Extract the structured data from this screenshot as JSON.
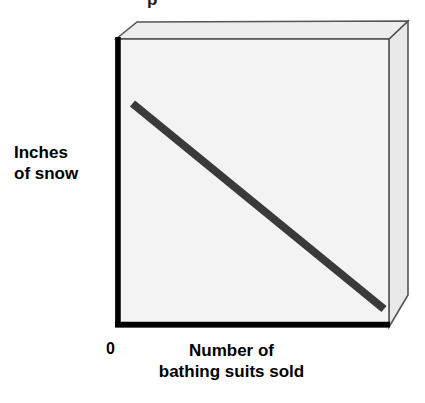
{
  "figure": {
    "kind": "3d-slab-scatter-plot",
    "top_fragment": "p",
    "origin_label": "0",
    "y_axis_label_lines": [
      "Inches",
      "of snow"
    ],
    "x_axis_label_lines": [
      "Number of",
      "bathing suits sold"
    ],
    "colors": {
      "background": "#ffffff",
      "plot_face": "#f3f3f3",
      "side_face": "#e9e9e9",
      "top_face": "#ededed",
      "axis": "#000000",
      "trend_line": "#3a3a3a",
      "thin_border": "#555555",
      "text": "#000000"
    }
  },
  "chart_data": {
    "type": "line",
    "title": "",
    "subtitle": "",
    "xlabel": "Number of bathing suits sold",
    "ylabel": "Inches of snow",
    "annotations": [
      "0"
    ],
    "legend": [],
    "legend_position": "none",
    "grid": false,
    "xlim": [
      0,
      100
    ],
    "ylim": [
      0,
      100
    ],
    "xticks": [
      0
    ],
    "xticklabels": [
      "0"
    ],
    "yticks": [],
    "yticklabels": [],
    "series": [
      {
        "name": "negative correlation trend",
        "style": "thick straight line",
        "color": "#3a3a3a",
        "x": [
          4,
          100
        ],
        "y": [
          79,
          4
        ],
        "points": [
          {
            "x": 4,
            "y": 79
          },
          {
            "x": 100,
            "y": 4
          }
        ]
      }
    ]
  }
}
